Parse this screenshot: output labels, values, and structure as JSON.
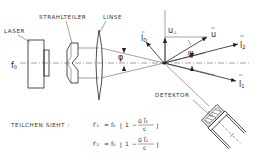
{
  "diagram": {
    "labels": {
      "laser": "LASER",
      "beam_splitter": "STRAHLTEILER",
      "lens": "LINSE",
      "detector": "DETEKTOR",
      "particle_sees": "TEILCHEN SIEHT :"
    },
    "symbols": {
      "f0": "f",
      "f0_sub": "0",
      "phi": "φ",
      "psi": "ψ",
      "lD": "l",
      "lD_sub": "D",
      "u_perp": "u",
      "u_perp_sub": "⊥",
      "u": "u",
      "l2": "l",
      "l2_sub": "2",
      "l1": "l",
      "l1_sub": "1"
    },
    "equations": [
      {
        "lhs": "f′₁",
        "eq": "=",
        "f0": "f₀",
        "bracket_open": "[",
        "one": "1",
        "minus": "−",
        "num": "u⃗ l⃗₁",
        "den": "c",
        "bracket_close": "]"
      },
      {
        "lhs": "f′₂",
        "eq": "=",
        "f0": "f₀",
        "bracket_open": "[",
        "one": "1",
        "minus": "−",
        "num": "u⃗ l⃗₂",
        "den": "c",
        "bracket_close": "]"
      }
    ]
  }
}
